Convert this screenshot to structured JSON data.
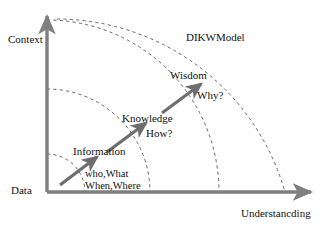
{
  "diagram": {
    "title": "DIKWModel",
    "axes": {
      "y_label": "Context",
      "x_label": "Understancding",
      "axis_color": "#7f7f7f",
      "origin": {
        "x": 47,
        "y": 192
      }
    },
    "arc_color": "#555555",
    "arrow_color": "#6e6e6e",
    "stages": [
      {
        "id": "data",
        "label": "Data",
        "question": "who,What When,Where",
        "question_lines": [
          "who,What",
          "When,Where"
        ]
      },
      {
        "id": "information",
        "label": "Information",
        "question": ""
      },
      {
        "id": "knowledge",
        "label": "Knowledge",
        "question": "How?"
      },
      {
        "id": "wisdom",
        "label": "Wisdom",
        "question": "Why?"
      }
    ],
    "arcs": [
      {
        "id": "arc-data",
        "radius": 38
      },
      {
        "id": "arc-information",
        "radius": 103
      },
      {
        "id": "arc-knowledge",
        "radius": 172
      },
      {
        "id": "arc-wisdom",
        "radius": 238
      }
    ],
    "arrows": [
      {
        "id": "arrow-data-to-information",
        "x1": 60,
        "y1": 185,
        "x2": 97,
        "y2": 157
      },
      {
        "id": "arrow-information-to-knowledge",
        "x1": 107,
        "y1": 152,
        "x2": 146,
        "y2": 123
      },
      {
        "id": "arrow-knowledge-to-wisdom",
        "x1": 162,
        "y1": 113,
        "x2": 201,
        "y2": 84
      }
    ]
  }
}
